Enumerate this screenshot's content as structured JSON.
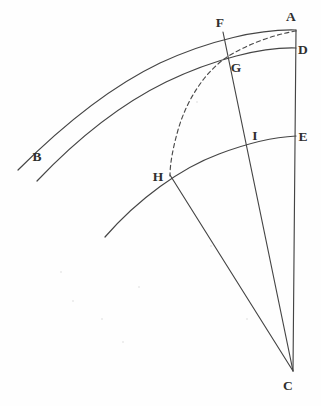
{
  "figure": {
    "background_color": "#fefefe",
    "stroke_color": "#454545",
    "label_color": "#2f2f2f",
    "width": 321,
    "height": 406,
    "points": [
      {
        "id": "A",
        "label": "A",
        "x": 296,
        "y": 30,
        "label_x": 291,
        "label_y": 21
      },
      {
        "id": "B",
        "label": "B",
        "x": 37,
        "y": 181,
        "label_x": 37,
        "label_y": 161
      },
      {
        "id": "C",
        "label": "C",
        "x": 293,
        "y": 371,
        "label_x": 288,
        "label_y": 390
      },
      {
        "id": "D",
        "label": "D",
        "x": 296,
        "y": 48,
        "label_x": 301,
        "label_y": 53
      },
      {
        "id": "E",
        "label": "E",
        "x": 296,
        "y": 136,
        "label_x": 301,
        "label_y": 141
      },
      {
        "id": "F",
        "label": "F",
        "x": 230,
        "y": 36,
        "label_x": 215,
        "label_y": 26
      },
      {
        "id": "G",
        "label": "G",
        "x": 227,
        "y": 57,
        "label_x": 232,
        "label_y": 72
      },
      {
        "id": "H",
        "label": "H",
        "x": 170,
        "y": 175,
        "label_x": 155,
        "label_y": 180
      },
      {
        "id": "I",
        "label": "I",
        "x": 253,
        "y": 146,
        "label_x": 253,
        "label_y": 141
      }
    ],
    "curves": [
      {
        "id": "outer-arc-AB",
        "name": "outer-arc",
        "style": "solid",
        "from": "A",
        "to": "B"
      },
      {
        "id": "middle-arc-DB",
        "name": "middle-arc",
        "style": "solid",
        "from": "D",
        "to": "B"
      },
      {
        "id": "lower-arc-EH",
        "name": "lower-arc",
        "style": "solid",
        "from": "E",
        "to": "H"
      },
      {
        "id": "dashed-arc-AH",
        "name": "dashed-arc",
        "style": "dashed",
        "from": "A",
        "to": "H"
      }
    ],
    "lines": [
      {
        "id": "line-AC",
        "name": "radius-line-a-c",
        "from": "A",
        "to": "C"
      },
      {
        "id": "line-FC",
        "name": "radius-line-f-c",
        "from": "F",
        "to": "C"
      },
      {
        "id": "line-HC",
        "name": "radius-line-h-c",
        "from": "H",
        "to": "C"
      }
    ],
    "specks": [
      {
        "x": 72,
        "y": 300,
        "size": 2
      },
      {
        "x": 101,
        "y": 318,
        "size": 2
      },
      {
        "x": 196,
        "y": 101,
        "size": 2
      },
      {
        "x": 122,
        "y": 341,
        "size": 2
      },
      {
        "x": 210,
        "y": 245,
        "size": 2
      },
      {
        "x": 60,
        "y": 271,
        "size": 2
      },
      {
        "x": 138,
        "y": 286,
        "size": 2
      },
      {
        "x": 246,
        "y": 318,
        "size": 2
      }
    ]
  }
}
